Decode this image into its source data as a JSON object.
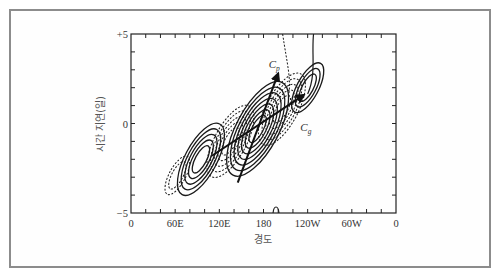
{
  "chart_data": {
    "type": "contour",
    "title": "",
    "xlabel": "경도",
    "ylabel": "시간 지연(일)",
    "x_ticks": [
      {
        "value": 0,
        "label": "0"
      },
      {
        "value": 60,
        "label": "60E"
      },
      {
        "value": 120,
        "label": "120E"
      },
      {
        "value": 180,
        "label": "180"
      },
      {
        "value": 240,
        "label": "120W"
      },
      {
        "value": 300,
        "label": "60W"
      },
      {
        "value": 360,
        "label": "0"
      }
    ],
    "y_ticks": [
      {
        "value": 5,
        "label": "+5"
      },
      {
        "value": 0,
        "label": "0"
      },
      {
        "value": -5,
        "label": "−5"
      }
    ],
    "xlim": [
      0,
      360
    ],
    "ylim": [
      -5,
      5
    ],
    "x_minor_tick_step": 20,
    "y_minor_tick_step": 1,
    "grid": false,
    "legend": null,
    "contour_styles": {
      "positive": "solid",
      "negative": "dashed"
    },
    "contour_centers": [
      {
        "sign": "negative",
        "lon": 63,
        "lag": -2.9,
        "levels": 2,
        "tilt_deg": 66
      },
      {
        "sign": "positive",
        "lon": 95,
        "lag": -2.0,
        "levels": 5,
        "tilt_deg": 66
      },
      {
        "sign": "negative",
        "lon": 135,
        "lag": -1.0,
        "levels": 5,
        "tilt_deg": 66
      },
      {
        "sign": "positive",
        "lon": 172,
        "lag": -0.3,
        "levels": 7,
        "tilt_deg": 66
      },
      {
        "sign": "negative",
        "lon": 205,
        "lag": 0.8,
        "levels": 5,
        "tilt_deg": 66
      },
      {
        "sign": "positive",
        "lon": 240,
        "lag": 2.0,
        "levels": 3,
        "tilt_deg": 66
      }
    ],
    "arrows": [
      {
        "name": "Cp",
        "label": "C",
        "subscript": "p",
        "from": {
          "lon": 145,
          "lag": -3.3
        },
        "to": {
          "lon": 200,
          "lag": 2.8
        }
      },
      {
        "name": "Cg",
        "label": "C",
        "subscript": "g",
        "from": {
          "lon": 110,
          "lag": -1.8
        },
        "to": {
          "lon": 235,
          "lag": 1.6
        }
      }
    ],
    "annotations": [
      {
        "text": "Cp",
        "lon": 187,
        "lag": 3.1
      },
      {
        "text": "Cg",
        "lon": 230,
        "lag": -0.4
      }
    ]
  },
  "colors": {
    "frame": "#8c8c8c",
    "axis": "#222222",
    "contour": "#1a1a1a",
    "text": "#333333"
  }
}
